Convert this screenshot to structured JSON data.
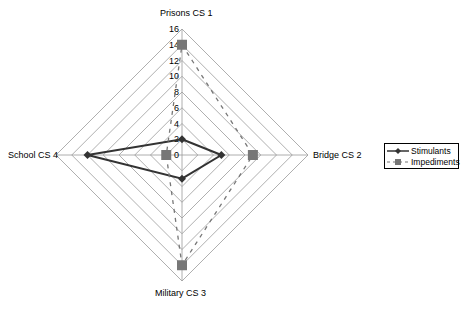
{
  "chart_data": {
    "type": "radar",
    "title": "",
    "categories": [
      "Prisons CS 1",
      "Bridge CS 2",
      "Military CS 3",
      "School CS 4"
    ],
    "series": [
      {
        "name": "Stimulants",
        "values": [
          2,
          5,
          3,
          12
        ],
        "style": "solid",
        "marker": "diamond",
        "color": "#333333"
      },
      {
        "name": "Impediments",
        "values": [
          14,
          9,
          14,
          2
        ],
        "style": "dashed",
        "marker": "square",
        "color": "#777777"
      }
    ],
    "axis": {
      "min": 0,
      "max": 16,
      "step": 2,
      "ticks": [
        "0",
        "2",
        "4",
        "6",
        "8",
        "10",
        "12",
        "14",
        "16"
      ]
    },
    "grid": true,
    "legend_position": "right"
  },
  "labels": {
    "top": "Prisons CS 1",
    "right": "Bridge CS 2",
    "bottom": "Military CS 3",
    "left": "School CS 4"
  },
  "legend": {
    "items": [
      {
        "label": "Stimulants"
      },
      {
        "label": "Impediments"
      }
    ]
  }
}
